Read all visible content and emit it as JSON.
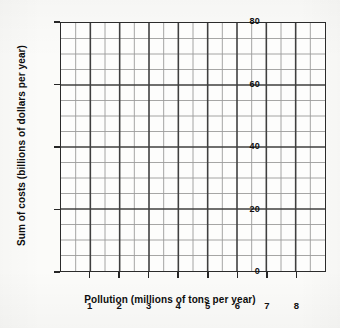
{
  "chart_data": {
    "type": "line",
    "title": "",
    "subtitle": "",
    "xlabel": "Pollution (millions of tons per year)",
    "ylabel": "Sum of costs (billions of dollars per year)",
    "xlim": [
      0,
      9
    ],
    "ylim": [
      0,
      80
    ],
    "x_major_ticks": [
      1,
      2,
      3,
      4,
      5,
      6,
      7,
      8
    ],
    "x_tick_labels": [
      "1",
      "2",
      "3",
      "4",
      "5",
      "6",
      "7",
      "8"
    ],
    "x_minor_step": 0.5,
    "x_major_step": 1,
    "y_major_ticks": [
      0,
      20,
      40,
      60,
      80
    ],
    "y_tick_labels": [
      "0",
      "20",
      "40",
      "60",
      "80"
    ],
    "y_minor_step": 5,
    "y_major_step": 20,
    "grid": true,
    "grid_style": "graph-paper",
    "legend": false,
    "legend_position": "none",
    "series": [],
    "values": [],
    "categories": [],
    "annotations": [],
    "note": "Blank graph-paper grid with no plotted data series; axes labelled only."
  },
  "axes": {
    "x_title": "Pollution (millions of tons per year)",
    "y_title": "Sum of costs (billions of dollars per year)",
    "x_ticks": [
      "1",
      "2",
      "3",
      "4",
      "5",
      "6",
      "7",
      "8"
    ],
    "y_ticks": [
      "0",
      "20",
      "40",
      "60",
      "80"
    ]
  },
  "colors": {
    "background": "#fbfbf9",
    "plot_background": "#fdfdfc",
    "axis": "#2b2b2b",
    "grid_major": "#4a4a4a",
    "grid_minor": "#8a8a8a",
    "text": "#111111"
  }
}
